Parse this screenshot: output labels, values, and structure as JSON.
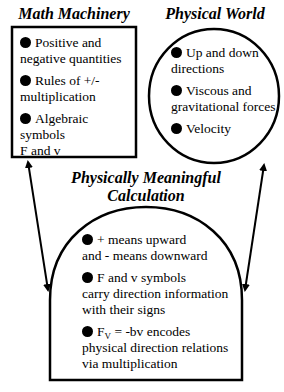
{
  "diagram": {
    "math_machinery": {
      "title": "Math Machinery",
      "shape": "rectangle",
      "items": [
        {
          "first": "Positive and",
          "rest": "negative quantities"
        },
        {
          "first": "Rules of +/-",
          "rest": "multiplication"
        },
        {
          "first": "Algebraic symbols",
          "rest": "F and v"
        }
      ]
    },
    "physical_world": {
      "title": "Physical World",
      "shape": "circle",
      "items": [
        {
          "first": "Up and down",
          "rest": "directions"
        },
        {
          "first": "Viscous and",
          "rest": "gravitational forces"
        },
        {
          "first": "Velocity",
          "rest": ""
        }
      ]
    },
    "calculation": {
      "title_line1": "Physically Meaningful",
      "title_line2": "Calculation",
      "shape": "arch",
      "items": [
        {
          "first": "+ means upward",
          "rest": "and - means downward"
        },
        {
          "first": "F and v symbols",
          "rest": "carry direction information",
          "rest2": "with their signs"
        },
        {
          "f": "F",
          "sub": "V",
          "after": " = -bv encodes",
          "rest": "physical direction relations",
          "rest2": "via multiplication"
        }
      ]
    },
    "arrows": [
      {
        "from": "math_machinery",
        "to": "calculation",
        "type": "double-headed"
      },
      {
        "from": "physical_world",
        "to": "calculation",
        "type": "double-headed"
      }
    ],
    "colors": {
      "stroke": "#000000",
      "background": "#ffffff"
    }
  }
}
